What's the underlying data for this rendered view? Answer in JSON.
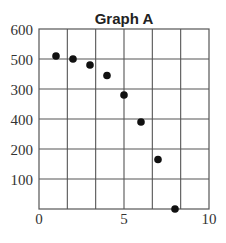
{
  "chart_data": {
    "type": "scatter",
    "title": "Graph A",
    "xlabel": "",
    "ylabel": "",
    "xlim": [
      0,
      10
    ],
    "ylim_positions": [
      0,
      6
    ],
    "x_ticks": [
      {
        "label": "0",
        "value": 0
      },
      {
        "label": "5",
        "value": 5
      },
      {
        "label": "10",
        "value": 10
      }
    ],
    "y_ticks_top_to_bottom": [
      "600",
      "500",
      "300",
      "400",
      "200",
      "100"
    ],
    "y_tick_note": "Labels are shown in the order 600, 500, 300, 400, 200, 100 (top to bottom) as printed; values below are read assuming an evenly spaced 0-600 scale",
    "grid": {
      "vertical_divisions": 6,
      "horizontal_divisions": 6
    },
    "x": [
      1,
      2,
      3,
      4,
      5,
      6,
      7,
      8
    ],
    "y": [
      510,
      500,
      480,
      445,
      380,
      290,
      165,
      0
    ],
    "marker": "filled-circle",
    "marker_color": "#111111",
    "grid_color": "#555555"
  },
  "labels": {
    "title": "Graph A",
    "y": [
      "600",
      "500",
      "300",
      "400",
      "200",
      "100"
    ],
    "x": [
      "0",
      "5",
      "10"
    ]
  }
}
